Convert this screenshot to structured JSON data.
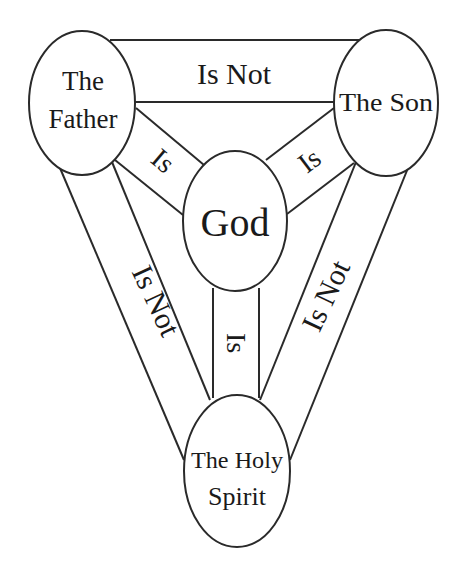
{
  "diagram": {
    "type": "shield-of-the-trinity",
    "nodes": {
      "father": {
        "line1": "The",
        "line2": "Father"
      },
      "son": {
        "label": "The Son"
      },
      "god": {
        "label": "God"
      },
      "spirit": {
        "line1": "The Holy",
        "line2": "Spirit"
      }
    },
    "edges": {
      "father_son": "Is Not",
      "father_spirit": "Is Not",
      "son_spirit": "Is Not",
      "father_god": "Is",
      "son_god": "Is",
      "spirit_god": "Is"
    },
    "colors": {
      "stroke": "#2a2a2a",
      "text": "#1a1a1a",
      "background": "#ffffff"
    }
  }
}
